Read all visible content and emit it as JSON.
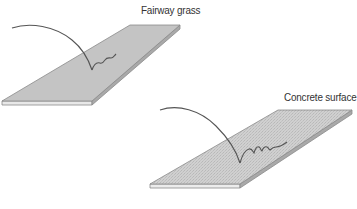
{
  "diagram": {
    "panels": [
      {
        "id": "fairway",
        "label": "Fairway grass",
        "surface_color": "#c4c4c4",
        "edge_color": "#e6e6e6",
        "texture": "smooth",
        "bounce": "short, damped"
      },
      {
        "id": "concrete",
        "label": "Concrete surface",
        "surface_color": "#cdcdcd",
        "edge_color": "#e8e8e8",
        "texture": "fine speckle",
        "bounce": "longer, repeated small bounces"
      }
    ],
    "line_color": "#555555",
    "outline_color": "#8a8a8a"
  }
}
